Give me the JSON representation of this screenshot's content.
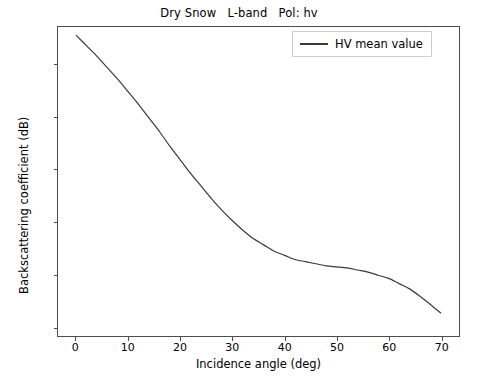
{
  "chart_data": {
    "type": "line",
    "title": "Dry Snow   L-band   Pol: hv",
    "xlabel": "Incidence angle (deg)",
    "ylabel": "Backscattering coefficient (dB)",
    "xlim": [
      -3.5,
      73.5
    ],
    "ylim": [
      -40.9,
      -11.4
    ],
    "xticks": [
      0,
      10,
      20,
      30,
      40,
      50,
      60,
      70
    ],
    "xtick_labels": [
      "0",
      "10",
      "20",
      "30",
      "40",
      "50",
      "60",
      "70"
    ],
    "yticks": [
      -15,
      -20,
      -25,
      -30,
      -35,
      -40
    ],
    "ytick_labels": [
      "−15",
      "−20",
      "−25",
      "−30",
      "−35",
      "−40"
    ],
    "grid": false,
    "legend_position": "upper right",
    "legend": [
      "HV mean value"
    ],
    "series": [
      {
        "name": "HV mean value",
        "color": "#3a3a3a",
        "linewidth": 1.2,
        "x": [
          0,
          2,
          4,
          6,
          8,
          10,
          12,
          14,
          16,
          18,
          20,
          22,
          24,
          26,
          28,
          30,
          32,
          34,
          36,
          38,
          40,
          42,
          44,
          46,
          48,
          50,
          52,
          54,
          56,
          58,
          60,
          62,
          64,
          66,
          68,
          70
        ],
        "y": [
          -12.2,
          -13.2,
          -14.2,
          -15.3,
          -16.4,
          -17.6,
          -18.8,
          -20.1,
          -21.4,
          -22.8,
          -24.1,
          -25.4,
          -26.6,
          -27.8,
          -28.9,
          -29.9,
          -30.8,
          -31.6,
          -32.2,
          -32.8,
          -33.2,
          -33.6,
          -33.8,
          -34.0,
          -34.2,
          -34.3,
          -34.4,
          -34.6,
          -34.8,
          -35.1,
          -35.4,
          -35.9,
          -36.4,
          -37.1,
          -37.9,
          -38.7
        ]
      }
    ]
  },
  "legend": {
    "entry_label": "HV mean value"
  }
}
